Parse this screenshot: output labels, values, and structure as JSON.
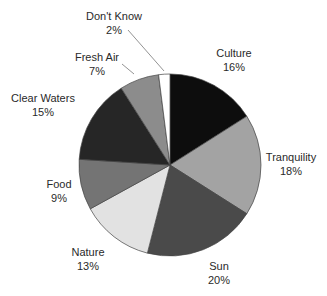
{
  "chart_data": {
    "type": "pie",
    "title": "",
    "start_angle_deg": 0,
    "direction": "clockwise",
    "slices": [
      {
        "label": "Culture",
        "value": 16,
        "display": "16%",
        "color": "#0d0d0d"
      },
      {
        "label": "Tranquility",
        "value": 18,
        "display": "18%",
        "color": "#a3a3a3"
      },
      {
        "label": "Sun",
        "value": 20,
        "display": "20%",
        "color": "#4a4a4a"
      },
      {
        "label": "Nature",
        "value": 13,
        "display": "13%",
        "color": "#e2e2e2"
      },
      {
        "label": "Food",
        "value": 9,
        "display": "9%",
        "color": "#747474"
      },
      {
        "label": "Clear Waters",
        "value": 15,
        "display": "15%",
        "color": "#262626"
      },
      {
        "label": "Fresh Air",
        "value": 7,
        "display": "7%",
        "color": "#8c8c8c"
      },
      {
        "label": "Don't Know",
        "value": 2,
        "display": "2%",
        "color": "#ffffff"
      }
    ],
    "legend": "none (direct labels)"
  },
  "labels": {
    "culture": {
      "name": "Culture",
      "pct": "16%"
    },
    "tranquility": {
      "name": "Tranquility",
      "pct": "18%"
    },
    "sun": {
      "name": "Sun",
      "pct": "20%"
    },
    "nature": {
      "name": "Nature",
      "pct": "13%"
    },
    "food": {
      "name": "Food",
      "pct": "9%"
    },
    "clear_waters": {
      "name": "Clear Waters",
      "pct": "15%"
    },
    "fresh_air": {
      "name": "Fresh Air",
      "pct": "7%"
    },
    "dont_know": {
      "name": "Don't Know",
      "pct": "2%"
    }
  }
}
